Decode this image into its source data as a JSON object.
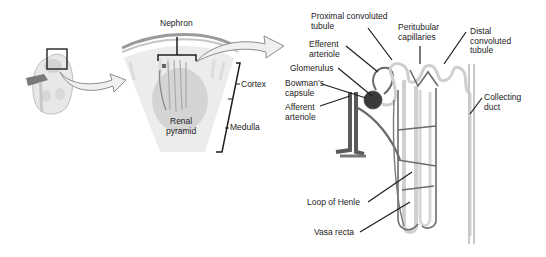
{
  "diagram": {
    "colors": {
      "background": "#ffffff",
      "line": "#1e1e1e",
      "tissue_light": "#e6e6e6",
      "tissue_mid": "#cfcfcf",
      "vessel_dark": "#555555",
      "glomerulus": "#3a3a3a",
      "tubule_light": "#d9d9d9"
    },
    "panels": [
      {
        "name": "kidney",
        "description": "Whole kidney with boxed region"
      },
      {
        "name": "renal-section",
        "description": "Cortex/medulla wedge with renal pyramid"
      },
      {
        "name": "nephron",
        "description": "Detailed nephron with capillaries"
      }
    ],
    "labels": {
      "nephron": "Nephron",
      "cortex": "Cortex",
      "renal_pyramid": "Renal\npyramid",
      "medulla": "Medulla",
      "proximal_convoluted_tubule": "Proximal convoluted\ntubule",
      "peritubular_capillaries": "Peritubular\ncapillaries",
      "distal_convoluted_tubule": "Distal\nconvoluted\ntubule",
      "efferent_arteriole": "Efferent\narteriole",
      "glomerulus": "Glomerulus",
      "bowmans_capsule": "Bowman's\ncapsule",
      "afferent_arteriole": "Afferent\narteriole",
      "collecting_duct": "Collecting\nduct",
      "loop_of_henle": "Loop of Henle",
      "vasa_recta": "Vasa recta"
    }
  }
}
